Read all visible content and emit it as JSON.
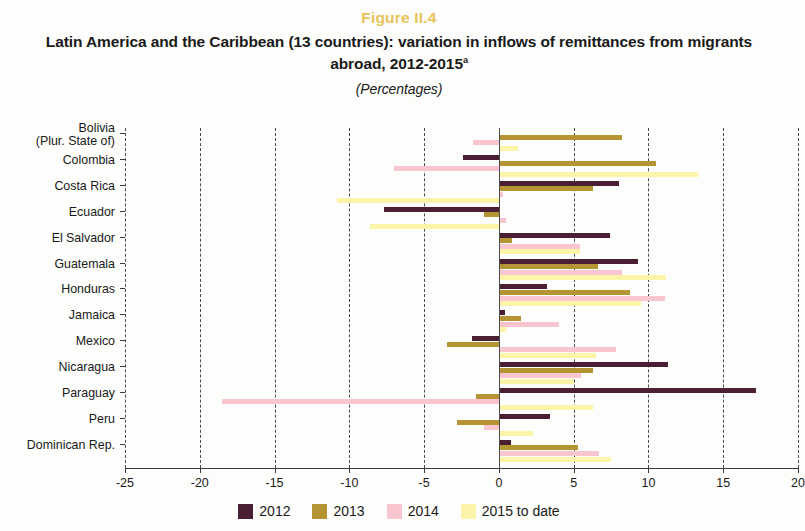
{
  "figure": {
    "number": "Figure II.4",
    "title": "Latin America and the Caribbean (13 countries): variation in inflows of remittances from migrants abroad, 2012-2015",
    "title_footnote": "a",
    "subtitle": "(Percentages)"
  },
  "legend": [
    {
      "label": "2012",
      "color": "#4a1f33"
    },
    {
      "label": "2013",
      "color": "#b59434"
    },
    {
      "label": "2014",
      "color": "#f9c6d0"
    },
    {
      "label": "2015 to date",
      "color": "#fcf4a8"
    }
  ],
  "chart_data": {
    "type": "bar",
    "orientation": "horizontal",
    "title": "Latin America and the Caribbean (13 countries): variation in inflows of remittances from migrants abroad, 2012-2015",
    "subtitle": "(Percentages)",
    "xlabel": "",
    "ylabel": "",
    "xlim": [
      -25,
      20
    ],
    "xticks": [
      -25,
      -20,
      -15,
      -10,
      -5,
      0,
      5,
      10,
      15,
      20
    ],
    "xticklabels": [
      "-25",
      "-20",
      "-15",
      "-10",
      "-5",
      "0",
      "5",
      "10",
      "15",
      "20"
    ],
    "grid": "vertical-dashed",
    "legend_position": "bottom",
    "categories": [
      "Bolivia\n(Plur. State of)",
      "Colombia",
      "Costa Rica",
      "Ecuador",
      "El Salvador",
      "Guatemala",
      "Honduras",
      "Jamaica",
      "Mexico",
      "Nicaragua",
      "Paraguay",
      "Peru",
      "Dominican Rep."
    ],
    "series": [
      {
        "name": "2012",
        "color": "#4a1f33",
        "values": [
          0.0,
          -2.4,
          8.0,
          -7.7,
          7.4,
          9.3,
          3.2,
          0.4,
          -1.8,
          11.3,
          17.2,
          3.4,
          0.8
        ]
      },
      {
        "name": "2013",
        "color": "#b59434",
        "values": [
          8.2,
          10.5,
          6.3,
          -1.0,
          0.9,
          6.6,
          8.8,
          1.5,
          -3.5,
          6.3,
          -1.5,
          -2.8,
          5.3
        ]
      },
      {
        "name": "2014",
        "color": "#f9c6d0",
        "values": [
          -1.7,
          -7.0,
          0.3,
          0.5,
          5.4,
          8.2,
          11.1,
          4.0,
          7.8,
          5.5,
          -18.5,
          -1.0,
          6.7
        ]
      },
      {
        "name": "2015 to date",
        "color": "#fcf4a8",
        "values": [
          1.3,
          13.3,
          -10.8,
          -8.6,
          5.4,
          11.2,
          9.5,
          0.5,
          6.5,
          5.0,
          6.3,
          2.3,
          7.5
        ]
      }
    ]
  }
}
